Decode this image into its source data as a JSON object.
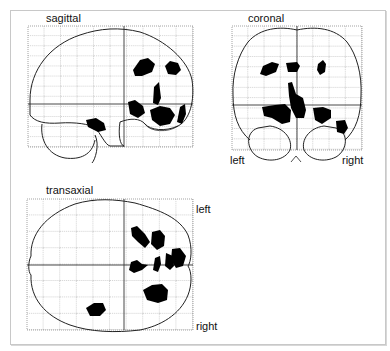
{
  "figure": {
    "background_color": "#ffffff",
    "blob_color": "#000000",
    "grid_color": "#555555",
    "outline_color": "#222222"
  },
  "panels": {
    "sagittal": {
      "label": "sagittal"
    },
    "coronal": {
      "label": "coronal",
      "left_label": "left",
      "right_label": "right"
    },
    "transaxial": {
      "label": "transaxial",
      "left_label": "left",
      "right_label": "right"
    }
  }
}
